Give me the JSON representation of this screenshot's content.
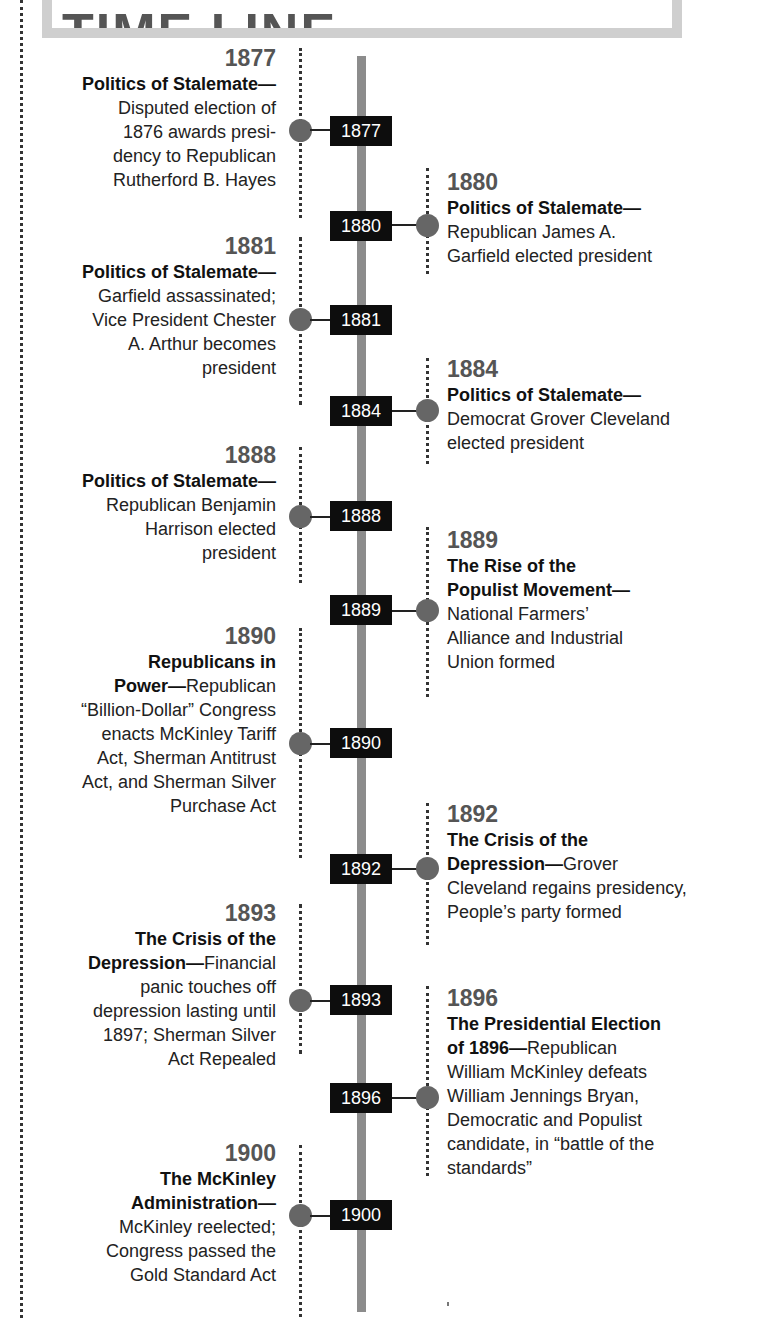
{
  "header": {
    "title": "TIME LINE"
  },
  "colors": {
    "bar": "#8c8c8c",
    "dot": "#666666",
    "year_box": "#0d0d0d",
    "year_text": "#555555",
    "header_border": "#cfcfcf"
  },
  "events": [
    {
      "year": "1877",
      "side": "left",
      "title": "Politics of Stalemate—",
      "text": "Disputed election of 1876 awards presi-dency to Republican Rutherford B. Hayes",
      "lines": [
        "Disputed election of",
        "1876 awards presi-",
        "dency to Republican",
        "Rutherford B. Hayes"
      ]
    },
    {
      "year": "1880",
      "side": "right",
      "title": "Politics of Stalemate—",
      "text": "Republican James A. Garfield elected president",
      "lines": [
        "Republican James A.",
        "Garfield elected president"
      ]
    },
    {
      "year": "1881",
      "side": "left",
      "title": "Politics of Stalemate—",
      "text": "Garfield assassinated; Vice President Chester A. Arthur becomes president",
      "lines": [
        "Garfield assassinated;",
        "Vice President Chester",
        "A. Arthur becomes",
        "president"
      ]
    },
    {
      "year": "1884",
      "side": "right",
      "title": "Politics of Stalemate—",
      "text": "Democrat Grover Cleveland elected president",
      "lines": [
        "Democrat Grover Cleveland",
        "elected president"
      ]
    },
    {
      "year": "1888",
      "side": "left",
      "title": "Politics of Stalemate—",
      "text": "Republican Benjamin Harrison elected president",
      "lines": [
        "Republican Benjamin",
        "Harrison elected",
        "president"
      ]
    },
    {
      "year": "1889",
      "side": "right",
      "title_lines": [
        "The Rise of the",
        "Populist Movement—"
      ],
      "text": "National Farmers’ Alliance and Industrial Union formed",
      "lines": [
        "National Farmers’",
        "Alliance and Industrial",
        "Union formed"
      ]
    },
    {
      "year": "1890",
      "side": "left",
      "title_lines": [
        "Republicans in",
        "Power—"
      ],
      "text": "Republican “Billion-Dollar” Congress enacts McKinley Tariff Act, Sherman Antitrust Act, and Sherman Silver Purchase Act",
      "inline_after_title": "Republican",
      "lines": [
        "“Billion-Dollar” Congress",
        "enacts McKinley Tariff",
        "Act, Sherman Antitrust",
        "Act, and Sherman Silver",
        "Purchase Act"
      ]
    },
    {
      "year": "1892",
      "side": "right",
      "title_lines": [
        "The Crisis of the",
        "Depression—"
      ],
      "text": "Grover Cleveland regains presidency, People’s party formed",
      "inline_after_title": "Grover",
      "lines": [
        "Cleveland regains presidency,",
        "People’s party formed"
      ]
    },
    {
      "year": "1893",
      "side": "left",
      "title_lines": [
        "The Crisis of the",
        "Depression—"
      ],
      "text": "Financial panic touches off depression lasting until 1897; Sherman Silver Act Repealed",
      "inline_after_title": "Financial",
      "lines": [
        "panic touches off",
        "depression lasting until",
        "1897; Sherman Silver",
        "Act Repealed"
      ]
    },
    {
      "year": "1896",
      "side": "right",
      "title_lines": [
        "The Presidential Election",
        "of 1896—"
      ],
      "text": "Republican William McKinley defeats William Jennings Bryan, Democratic and Populist candidate, in “battle of the standards”",
      "inline_after_title": "Republican",
      "lines": [
        "William McKinley defeats",
        "William Jennings Bryan,",
        "Democratic and Populist",
        "candidate, in “battle of the",
        "standards”"
      ]
    },
    {
      "year": "1900",
      "side": "left",
      "title_lines": [
        "The McKinley",
        "Administration—"
      ],
      "text": "McKinley reelected; Congress passed the Gold Standard Act",
      "lines": [
        "McKinley reelected;",
        "Congress passed the",
        "Gold Standard Act"
      ]
    }
  ]
}
